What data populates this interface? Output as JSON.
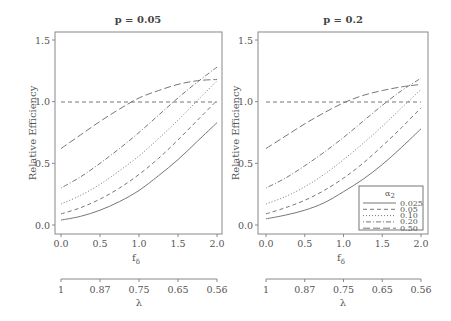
{
  "chart_data": [
    {
      "type": "line",
      "title": "p = 0.05",
      "xlabel": "f_δ",
      "ylabel": "Relative Efficiency",
      "xlim": [
        0,
        2
      ],
      "ylim": [
        0,
        1.5
      ],
      "x": [
        0,
        0.25,
        0.5,
        0.75,
        1.0,
        1.25,
        1.5,
        1.75,
        2.0
      ],
      "xticks": [
        "0.0",
        "0.5",
        "1.0",
        "1.5",
        "2.0"
      ],
      "yticks": [
        "0.0",
        "0.5",
        "1.0",
        "1.5"
      ],
      "reference_line": 1.0,
      "secondary_axis": {
        "label": "λ",
        "ticks": [
          "1",
          "0.87",
          "0.75",
          "0.65",
          "0.56"
        ]
      },
      "series": [
        {
          "name": "0.025",
          "style": "solid",
          "values": [
            0.04,
            0.07,
            0.12,
            0.19,
            0.28,
            0.4,
            0.53,
            0.68,
            0.83
          ]
        },
        {
          "name": "0.05",
          "style": "dashed",
          "values": [
            0.09,
            0.14,
            0.21,
            0.3,
            0.41,
            0.54,
            0.69,
            0.85,
            1.01
          ]
        },
        {
          "name": "0.10",
          "style": "dotted",
          "values": [
            0.17,
            0.24,
            0.33,
            0.44,
            0.56,
            0.7,
            0.85,
            1.01,
            1.17
          ]
        },
        {
          "name": "0.20",
          "style": "dotdash",
          "values": [
            0.3,
            0.39,
            0.5,
            0.62,
            0.75,
            0.89,
            1.03,
            1.16,
            1.28
          ]
        },
        {
          "name": "0.50",
          "style": "longdash",
          "values": [
            0.62,
            0.73,
            0.84,
            0.94,
            1.03,
            1.09,
            1.14,
            1.17,
            1.18
          ]
        }
      ]
    },
    {
      "type": "line",
      "title": "p = 0.2",
      "xlabel": "f_δ",
      "ylabel": "Relative Efficiency",
      "xlim": [
        0,
        2
      ],
      "ylim": [
        0,
        1.5
      ],
      "x": [
        0,
        0.25,
        0.5,
        0.75,
        1.0,
        1.25,
        1.5,
        1.75,
        2.0
      ],
      "xticks": [
        "0.0",
        "0.5",
        "1.0",
        "1.5",
        "2.0"
      ],
      "yticks": [
        "0.0",
        "0.5",
        "1.0",
        "1.5"
      ],
      "reference_line": 1.0,
      "secondary_axis": {
        "label": "λ",
        "ticks": [
          "1",
          "0.87",
          "0.75",
          "0.65",
          "0.56"
        ]
      },
      "legend": {
        "title": "α2",
        "position": "bottom-right",
        "entries": [
          "0.025",
          "0.05",
          "0.10",
          "0.20",
          "0.50"
        ]
      },
      "series": [
        {
          "name": "0.025",
          "style": "solid",
          "values": [
            0.05,
            0.08,
            0.12,
            0.18,
            0.27,
            0.37,
            0.49,
            0.63,
            0.78
          ]
        },
        {
          "name": "0.05",
          "style": "dashed",
          "values": [
            0.09,
            0.14,
            0.2,
            0.28,
            0.38,
            0.5,
            0.64,
            0.79,
            0.95
          ]
        },
        {
          "name": "0.10",
          "style": "dotted",
          "values": [
            0.17,
            0.23,
            0.31,
            0.41,
            0.53,
            0.66,
            0.8,
            0.95,
            1.1
          ]
        },
        {
          "name": "0.20",
          "style": "dotdash",
          "values": [
            0.3,
            0.38,
            0.48,
            0.59,
            0.71,
            0.84,
            0.97,
            1.09,
            1.19
          ]
        },
        {
          "name": "0.50",
          "style": "longdash",
          "values": [
            0.62,
            0.72,
            0.82,
            0.91,
            0.99,
            1.05,
            1.09,
            1.12,
            1.14
          ]
        }
      ]
    }
  ],
  "panels": [
    {
      "title": "p = 0.05",
      "ylabel": "Relative Efficiency",
      "xlabel_main": "f",
      "xlabel_sub": "δ",
      "lambda_label": "λ"
    },
    {
      "title": "p = 0.2",
      "ylabel": "Relative Efficiency",
      "xlabel_main": "f",
      "xlabel_sub": "δ",
      "lambda_label": "λ"
    }
  ],
  "legend": {
    "title_main": "α",
    "title_sub": "2",
    "entries": [
      "0.025",
      "0.05",
      "0.10",
      "0.20",
      "0.50"
    ]
  },
  "colors": {
    "line": "#777777",
    "axis": "#888888",
    "text": "#555555"
  }
}
